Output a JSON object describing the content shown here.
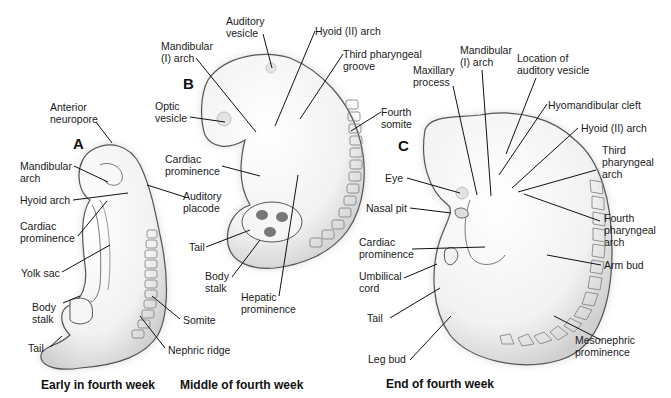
{
  "figure": {
    "panels": [
      {
        "id": "A",
        "letter": "A",
        "caption": "Early in fourth week",
        "labels": [
          {
            "key": "anterior_neuropore",
            "text": "Anterior\nneuropore"
          },
          {
            "key": "mandibular_arch",
            "text": "Mandibular\narch"
          },
          {
            "key": "hyoid_arch",
            "text": "Hyoid arch"
          },
          {
            "key": "cardiac_prominence",
            "text": "Cardiac\nprominence"
          },
          {
            "key": "yolk_sac",
            "text": "Yolk sac"
          },
          {
            "key": "body_stalk",
            "text": "Body\nstalk"
          },
          {
            "key": "tail",
            "text": "Tail"
          },
          {
            "key": "auditory_placode",
            "text": "Auditory\nplacode"
          },
          {
            "key": "somite",
            "text": "Somite"
          },
          {
            "key": "nephric_ridge",
            "text": "Nephric ridge"
          }
        ]
      },
      {
        "id": "B",
        "letter": "B",
        "caption": "Middle of fourth week",
        "labels": [
          {
            "key": "auditory_vesicle",
            "text": "Auditory\nvesicle"
          },
          {
            "key": "mandibular_i_arch",
            "text": "Mandibular\n(I) arch"
          },
          {
            "key": "hyoid_ii_arch",
            "text": "Hyoid (II) arch"
          },
          {
            "key": "third_pharyngeal_groove",
            "text": "Third pharyngeal\ngroove"
          },
          {
            "key": "optic_vesicle",
            "text": "Optic\nvesicle"
          },
          {
            "key": "fourth_somite",
            "text": "Fourth\nsomite"
          },
          {
            "key": "cardiac_prominence",
            "text": "Cardiac\nprominence"
          },
          {
            "key": "tail",
            "text": "Tail"
          },
          {
            "key": "body_stalk",
            "text": "Body\nstalk"
          },
          {
            "key": "hepatic_prominence",
            "text": "Hepatic\nprominence"
          }
        ]
      },
      {
        "id": "C",
        "letter": "C",
        "caption": "End of fourth week",
        "labels": [
          {
            "key": "maxillary_process",
            "text": "Maxillary\nprocess"
          },
          {
            "key": "mandibular_i_arch",
            "text": "Mandibular\n(I) arch"
          },
          {
            "key": "location_auditory_vesicle",
            "text": "Location of\nauditory vesicle"
          },
          {
            "key": "hyomandibular_cleft",
            "text": "Hyomandibular cleft"
          },
          {
            "key": "hyoid_ii_arch",
            "text": "Hyoid (II) arch"
          },
          {
            "key": "third_pharyngeal_arch",
            "text": "Third\npharyngeal\narch"
          },
          {
            "key": "eye",
            "text": "Eye"
          },
          {
            "key": "nasal_pit",
            "text": "Nasal pit"
          },
          {
            "key": "fourth_pharyngeal_arch",
            "text": "Fourth\npharyngeal\narch"
          },
          {
            "key": "cardiac_prominence",
            "text": "Cardiac\nprominence"
          },
          {
            "key": "umbilical_cord",
            "text": "Umbilical\ncord"
          },
          {
            "key": "arm_bud",
            "text": "Arm bud"
          },
          {
            "key": "tail",
            "text": "Tail"
          },
          {
            "key": "leg_bud",
            "text": "Leg bud"
          },
          {
            "key": "mesonephric_prominence",
            "text": "Mesonephric\nprominence"
          }
        ]
      }
    ],
    "colors": {
      "background": "#ffffff",
      "embryo_fill": "#f4f4f4",
      "embryo_shadow": "#c8c8c8",
      "outline": "#555555",
      "leader_line": "#111111",
      "text": "#1a1a1a"
    }
  }
}
